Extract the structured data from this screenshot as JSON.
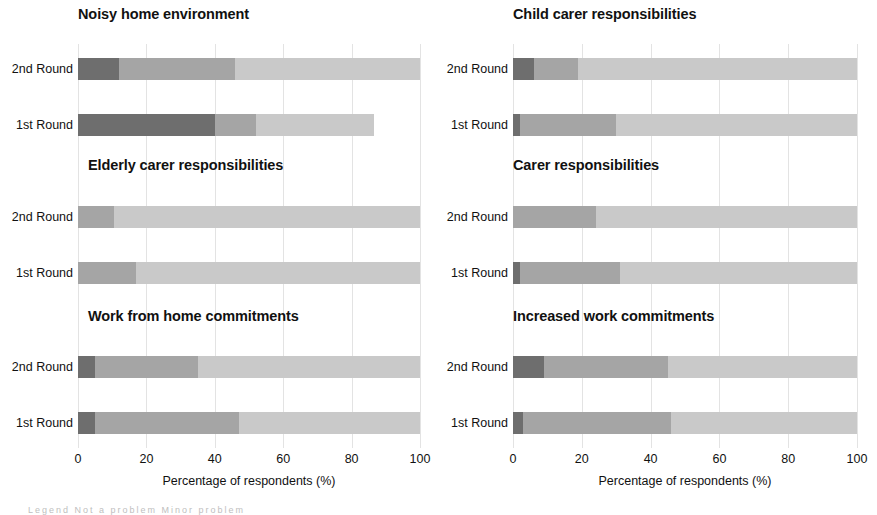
{
  "figure": {
    "xlabel": "Percentage of respondents (%)",
    "xticks": [
      "0",
      "20",
      "40",
      "60",
      "80",
      "100"
    ],
    "xtick_values": [
      0,
      20,
      40,
      60,
      80,
      100
    ],
    "row_labels": [
      "2nd Round",
      "1st Round"
    ],
    "colors": {
      "dark": "#6e6e6e",
      "medium": "#a5a5a5",
      "light": "#c9c9c9",
      "grid": "#e3e3e3",
      "text": "#111111",
      "background": "#ffffff"
    },
    "legend_hint": "Legend   Not a problem   Minor problem"
  },
  "chart_data": {
    "type": "bar",
    "orientation": "horizontal",
    "stacked": true,
    "percent_stacked": true,
    "title": "",
    "xlabel": "Percentage of respondents (%)",
    "ylabel": "",
    "xlim": [
      0,
      100
    ],
    "grid": true,
    "grid_axis": "x",
    "legend_position": "below",
    "categories": [
      "2nd Round",
      "1st Round"
    ],
    "series": [
      {
        "name": "Major problem",
        "color": "#6e6e6e"
      },
      {
        "name": "Moderate problem",
        "color": "#a5a5a5"
      },
      {
        "name": "Not a problem",
        "color": "#c9c9c9"
      }
    ],
    "panels": [
      {
        "title": "Noisy home environment",
        "position": "top-left",
        "rows": [
          {
            "label": "2nd Round",
            "values": [
              12,
              34,
              54
            ],
            "total": 100
          },
          {
            "label": "1st Round",
            "values": [
              40,
              12,
              34.5
            ],
            "total": 86.5
          }
        ]
      },
      {
        "title": "Child carer responsibilities",
        "position": "top-right",
        "rows": [
          {
            "label": "2nd Round",
            "values": [
              6,
              13,
              81
            ],
            "total": 100
          },
          {
            "label": "1st Round",
            "values": [
              2,
              28,
              70
            ],
            "total": 100
          }
        ]
      },
      {
        "title": "Elderly carer responsibilities",
        "position": "middle-left",
        "rows": [
          {
            "label": "2nd Round",
            "values": [
              0,
              10.5,
              89.5
            ],
            "total": 100
          },
          {
            "label": "1st Round",
            "values": [
              0,
              17,
              83
            ],
            "total": 100
          }
        ]
      },
      {
        "title": "Carer responsibilities",
        "position": "middle-right",
        "rows": [
          {
            "label": "2nd Round",
            "values": [
              0,
              24,
              76
            ],
            "total": 100
          },
          {
            "label": "1st Round",
            "values": [
              2,
              29,
              69
            ],
            "total": 100
          }
        ]
      },
      {
        "title": "Work from home commitments",
        "position": "bottom-left",
        "rows": [
          {
            "label": "2nd Round",
            "values": [
              5,
              30,
              65
            ],
            "total": 100
          },
          {
            "label": "1st Round",
            "values": [
              5,
              42,
              53
            ],
            "total": 100
          }
        ]
      },
      {
        "title": "Increased work commitments",
        "position": "bottom-right",
        "rows": [
          {
            "label": "2nd Round",
            "values": [
              9,
              36,
              55
            ],
            "total": 100
          },
          {
            "label": "1st Round",
            "values": [
              3,
              43,
              54
            ],
            "total": 100
          }
        ]
      }
    ]
  }
}
